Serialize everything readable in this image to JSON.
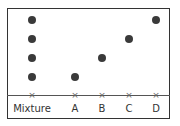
{
  "lanes": [
    {
      "label": "Mixture",
      "x": 32,
      "spots_y": [
        20,
        39,
        58,
        77
      ]
    },
    {
      "label": "A",
      "x": 75,
      "spots_y": [
        77
      ]
    },
    {
      "label": "B",
      "x": 102,
      "spots_y": [
        58
      ]
    },
    {
      "label": "C",
      "x": 129,
      "spots_y": [
        39
      ]
    },
    {
      "label": "D",
      "x": 156,
      "spots_y": [
        20
      ]
    }
  ],
  "baseline_marker": "×",
  "colors": {
    "spot": "#3a3a3a",
    "line": "#555555"
  }
}
